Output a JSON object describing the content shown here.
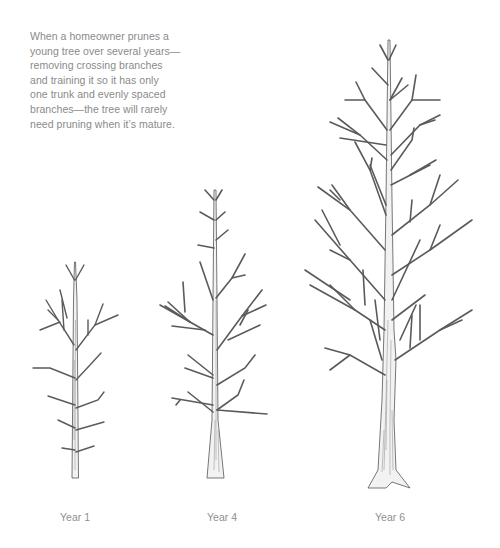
{
  "caption": {
    "lines": [
      "When a homeowner prunes a",
      "young tree over several years—",
      "removing crossing branches",
      "and training it so it has only",
      "one trunk and evenly spaced",
      "branches—the tree will rarely",
      "need pruning when it’s mature."
    ]
  },
  "trees": [
    {
      "label": "Year 1",
      "label_x": 75
    },
    {
      "label": "Year 4",
      "label_x": 222
    },
    {
      "label": "Year 6",
      "label_x": 390
    }
  ],
  "colors": {
    "text": "#8a8a8a",
    "ink": "#555555",
    "background": "#ffffff"
  }
}
